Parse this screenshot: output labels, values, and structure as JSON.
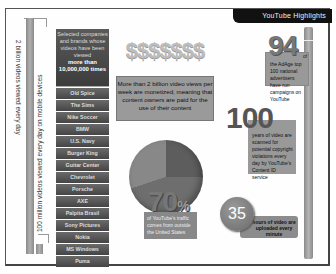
{
  "banner": {
    "title": "YouTube Highlights"
  },
  "left_bars": {
    "label_top": "2 billion videos viewed every day",
    "label_bottom": "100 million videos viewed every day on mobile devices"
  },
  "brands": {
    "header_line1": "Selected companies and brands whose videos have been viewed",
    "header_line2": "more than 10,000,000 times",
    "items": [
      "Old Spice",
      "The Sims",
      "Nike Soccer",
      "BMW",
      "U.S. Navy",
      "Burger King",
      "Guitar Center",
      "Chevrolet",
      "Porsche",
      "AXE",
      "Palpita Brasil",
      "Sony Pictures",
      "Nokia",
      "MS Windows",
      "Puma"
    ]
  },
  "monetized": {
    "dollars": "$$$$$$$",
    "text": "More than 2 billion video views per week are monetized, meaning that content owners are paid for the use of their content"
  },
  "traffic": {
    "value": "70",
    "unit": "%",
    "text": "of YouTube's traffic comes from outside the United States"
  },
  "adage": {
    "value": "94",
    "suffix": "of",
    "text": "the AdAge top 100 national advertisers have run campaigns on YouTube"
  },
  "content_id": {
    "value": "100",
    "text": "years of video are scanned for potential copyright violations every day by YouTube's Content ID service"
  },
  "uploads": {
    "value": "35",
    "text": "hours of video are uploaded every minute"
  }
}
